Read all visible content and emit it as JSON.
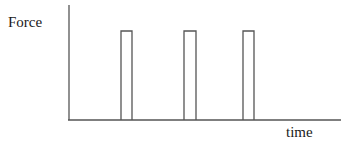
{
  "diagram": {
    "y_axis_label": "Force",
    "x_axis_label": "time",
    "line_color": "#555555",
    "pulses": [
      {
        "index": 1,
        "x_start": 121,
        "x_end": 132,
        "top": 31
      },
      {
        "index": 2,
        "x_start": 184,
        "x_end": 196,
        "top": 31
      },
      {
        "index": 3,
        "x_start": 243,
        "x_end": 254,
        "top": 31
      }
    ],
    "axes": {
      "origin": [
        69,
        120
      ],
      "y_top": 5,
      "x_end": 341
    }
  }
}
